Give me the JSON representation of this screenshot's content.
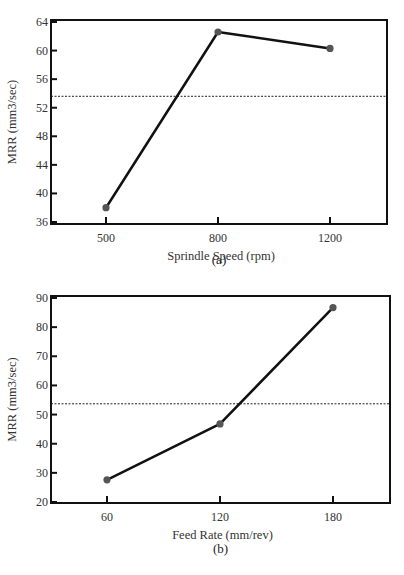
{
  "chart_data": [
    {
      "type": "line",
      "panel": "(a)",
      "caption": "(a)",
      "xlabel": "Sprindle Speed (rpm)",
      "ylabel": "MRR (mm3/sec)",
      "categories": [
        "500",
        "800",
        "1200"
      ],
      "values": [
        38.0,
        62.6,
        60.3
      ],
      "mean_line": 53.6,
      "yticks": [
        36,
        40,
        44,
        48,
        52,
        56,
        60,
        64
      ],
      "ylim": [
        36,
        64
      ],
      "grid": false,
      "legend": null
    },
    {
      "type": "line",
      "panel": "(b)",
      "caption": "(b)",
      "xlabel": "Feed Rate (mm/rev)",
      "ylabel": "MRR (mm3/sec)",
      "categories": [
        "60",
        "120",
        "180"
      ],
      "values": [
        27.6,
        46.8,
        86.7
      ],
      "mean_line": 53.7,
      "yticks": [
        20,
        30,
        40,
        50,
        60,
        70,
        80,
        90
      ],
      "ylim": [
        20,
        90
      ],
      "grid": false,
      "legend": null
    }
  ],
  "style": {
    "line_color": "#111111",
    "marker_color": "#555555",
    "mean_line_color": "#222222",
    "frame_color": "#111111"
  }
}
